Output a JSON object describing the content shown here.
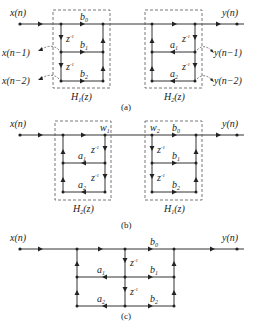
{
  "figure": {
    "panels": [
      {
        "caption": "(a)",
        "input": "x(n)",
        "output": "y(n)",
        "blocks": [
          {
            "name": "H",
            "sub": "1",
            "arg": "(z)",
            "coeffs": [
              "b",
              "b",
              "b"
            ],
            "coeff_subs": [
              "0",
              "1",
              "2"
            ],
            "delay": "z",
            "delay_sup": "-1"
          },
          {
            "name": "H",
            "sub": "2",
            "arg": "(z)",
            "coeffs": [
              "a",
              "a"
            ],
            "coeff_subs": [
              "1",
              "2"
            ],
            "delay": "z",
            "delay_sup": "-1"
          }
        ],
        "taps_left": [
          "x(n−1)",
          "x(n−2)"
        ],
        "taps_right": [
          "y(n−1)",
          "y(n−2)"
        ]
      },
      {
        "caption": "(b)",
        "input": "x(n)",
        "output": "y(n)",
        "nodes": {
          "w1": "w",
          "w1_sub": "1",
          "w2": "w",
          "w2_sub": "2"
        },
        "blocks": [
          {
            "name": "H",
            "sub": "2",
            "arg": "(z)"
          },
          {
            "name": "H",
            "sub": "1",
            "arg": "(z)"
          }
        ]
      },
      {
        "caption": "(c)",
        "input": "x(n)",
        "output": "y(n)"
      }
    ],
    "symbols": {
      "b": "b",
      "a": "a",
      "z": "z",
      "neg1": "-1",
      "s0": "0",
      "s1": "1",
      "s2": "2",
      "H": "H",
      "zarg": "(z)",
      "w": "w"
    }
  }
}
